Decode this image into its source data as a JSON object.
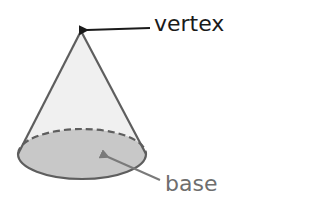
{
  "diagram": {
    "labels": {
      "vertex": "vertex",
      "base": "base"
    },
    "colors": {
      "cone_fill": "#f0f0f0",
      "base_fill": "#c8c8c8",
      "outline": "#5e5e5e",
      "vertex_text": "#1a1a1a",
      "base_text": "#6e6e6e",
      "vertex_arrow": "#1a1a1a",
      "base_arrow": "#7a7a7a"
    }
  }
}
